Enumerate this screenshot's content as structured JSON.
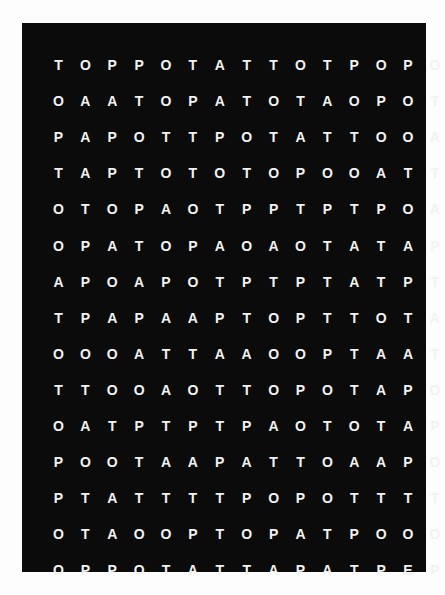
{
  "puzzle": {
    "type": "word-search-grid",
    "rows": 15,
    "columns": 15,
    "grid": [
      [
        "T",
        "O",
        "P",
        "P",
        "O",
        "T",
        "A",
        "T",
        "T",
        "O",
        "T",
        "P",
        "O",
        "P",
        "O"
      ],
      [
        "O",
        "A",
        "A",
        "T",
        "O",
        "P",
        "A",
        "T",
        "O",
        "T",
        "A",
        "O",
        "P",
        "O",
        "T"
      ],
      [
        "P",
        "A",
        "P",
        "O",
        "T",
        "T",
        "P",
        "O",
        "T",
        "A",
        "T",
        "T",
        "O",
        "O",
        "A"
      ],
      [
        "T",
        "A",
        "P",
        "T",
        "O",
        "T",
        "O",
        "T",
        "O",
        "P",
        "O",
        "O",
        "A",
        "T",
        "T"
      ],
      [
        "O",
        "T",
        "O",
        "P",
        "A",
        "O",
        "T",
        "P",
        "P",
        "T",
        "P",
        "T",
        "P",
        "O",
        "A"
      ],
      [
        "O",
        "P",
        "A",
        "T",
        "O",
        "P",
        "A",
        "O",
        "A",
        "O",
        "T",
        "A",
        "T",
        "A",
        "P"
      ],
      [
        "A",
        "P",
        "O",
        "A",
        "P",
        "O",
        "T",
        "P",
        "T",
        "P",
        "T",
        "A",
        "T",
        "P",
        "T"
      ],
      [
        "T",
        "P",
        "A",
        "P",
        "A",
        "A",
        "P",
        "T",
        "O",
        "P",
        "T",
        "T",
        "O",
        "T",
        "A"
      ],
      [
        "O",
        "O",
        "O",
        "A",
        "T",
        "T",
        "A",
        "A",
        "O",
        "O",
        "P",
        "T",
        "A",
        "A",
        "T"
      ],
      [
        "T",
        "T",
        "O",
        "O",
        "A",
        "O",
        "T",
        "T",
        "O",
        "P",
        "O",
        "T",
        "A",
        "P",
        "O"
      ],
      [
        "O",
        "A",
        "T",
        "P",
        "T",
        "P",
        "T",
        "P",
        "A",
        "O",
        "T",
        "O",
        "T",
        "A",
        "P"
      ],
      [
        "P",
        "O",
        "O",
        "T",
        "A",
        "A",
        "P",
        "A",
        "T",
        "T",
        "O",
        "A",
        "A",
        "P",
        "O"
      ],
      [
        "P",
        "T",
        "A",
        "T",
        "T",
        "T",
        "T",
        "P",
        "O",
        "P",
        "O",
        "T",
        "T",
        "T",
        "T"
      ],
      [
        "O",
        "T",
        "A",
        "O",
        "O",
        "P",
        "T",
        "O",
        "P",
        "A",
        "T",
        "P",
        "O",
        "O",
        "O"
      ],
      [
        "O",
        "P",
        "P",
        "O",
        "T",
        "A",
        "T",
        "T",
        "A",
        "P",
        "A",
        "T",
        "P",
        "E",
        "P"
      ]
    ]
  },
  "colors": {
    "panel_background": "#0b0b0b",
    "letter_color": "#f2f2f2",
    "page_background": "#fdfdfd"
  }
}
